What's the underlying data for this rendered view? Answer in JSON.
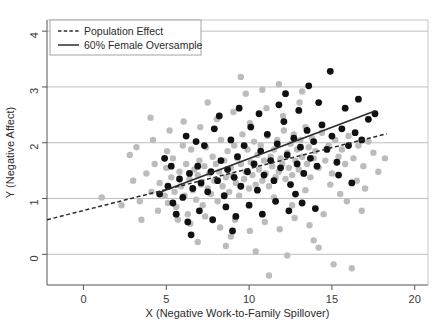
{
  "chart_data": {
    "type": "scatter",
    "title": "",
    "xlabel": "X (Negative Work-to-Family Spillover)",
    "ylabel": "Y (Negative Affect)",
    "xlim": [
      -2.2,
      20.8
    ],
    "ylim": [
      -0.55,
      4.2
    ],
    "xticks": [
      0,
      5,
      10,
      15,
      20
    ],
    "yticks": [
      0,
      1,
      2,
      3,
      4
    ],
    "xtick_labels": [
      "0",
      "5",
      "10",
      "15",
      "20"
    ],
    "ytick_labels": [
      "0",
      "1",
      "2",
      "3",
      "4"
    ],
    "grid": "horizontal",
    "grid_color": "#b8b8b8",
    "legend_position": "top-left",
    "series": [
      {
        "name": "Population Sample",
        "marker": "circle",
        "color": "#bcbcbc",
        "size": 3.2,
        "points": [
          [
            1.1,
            1.02
          ],
          [
            2.3,
            0.88
          ],
          [
            3.0,
            1.32
          ],
          [
            3.4,
            0.95
          ],
          [
            3.8,
            1.45
          ],
          [
            4.1,
            1.12
          ],
          [
            4.3,
            1.62
          ],
          [
            4.5,
            0.78
          ],
          [
            4.6,
            1.28
          ],
          [
            4.9,
            1.05
          ],
          [
            5.0,
            1.55
          ],
          [
            5.1,
            0.92
          ],
          [
            5.3,
            1.38
          ],
          [
            5.4,
            1.72
          ],
          [
            5.5,
            1.12
          ],
          [
            5.6,
            0.85
          ],
          [
            5.8,
            1.48
          ],
          [
            5.9,
            1.22
          ],
          [
            6.0,
            1.95
          ],
          [
            6.1,
            1.05
          ],
          [
            6.2,
            1.62
          ],
          [
            6.3,
            0.72
          ],
          [
            6.4,
            1.35
          ],
          [
            6.5,
            1.88
          ],
          [
            6.6,
            1.15
          ],
          [
            6.7,
            1.52
          ],
          [
            6.8,
            0.98
          ],
          [
            6.9,
            1.42
          ],
          [
            7.0,
            1.68
          ],
          [
            7.1,
            1.25
          ],
          [
            7.2,
            0.88
          ],
          [
            7.3,
            1.58
          ],
          [
            7.4,
            1.92
          ],
          [
            7.5,
            1.18
          ],
          [
            7.6,
            1.45
          ],
          [
            7.7,
            1.08
          ],
          [
            7.8,
            1.75
          ],
          [
            7.9,
            1.32
          ],
          [
            8.0,
            1.62
          ],
          [
            8.1,
            0.95
          ],
          [
            8.2,
            1.48
          ],
          [
            8.3,
            2.05
          ],
          [
            8.4,
            1.22
          ],
          [
            8.5,
            1.68
          ],
          [
            8.6,
            1.38
          ],
          [
            8.7,
            1.85
          ],
          [
            8.8,
            1.12
          ],
          [
            8.9,
            1.55
          ],
          [
            9.0,
            1.42
          ],
          [
            9.1,
            1.95
          ],
          [
            9.2,
            1.28
          ],
          [
            9.3,
            1.72
          ],
          [
            9.4,
            1.05
          ],
          [
            9.5,
            1.62
          ],
          [
            9.6,
            2.15
          ],
          [
            9.7,
            1.35
          ],
          [
            9.8,
            1.48
          ],
          [
            9.9,
            1.88
          ],
          [
            10.0,
            1.18
          ],
          [
            10.1,
            1.65
          ],
          [
            10.2,
            1.42
          ],
          [
            10.3,
            2.02
          ],
          [
            10.4,
            1.25
          ],
          [
            10.5,
            1.78
          ],
          [
            10.6,
            1.52
          ],
          [
            10.7,
            1.95
          ],
          [
            10.8,
            1.32
          ],
          [
            10.9,
            1.68
          ],
          [
            11.0,
            1.45
          ],
          [
            11.1,
            2.12
          ],
          [
            11.2,
            1.22
          ],
          [
            11.3,
            1.75
          ],
          [
            11.4,
            1.58
          ],
          [
            11.5,
            1.88
          ],
          [
            11.6,
            1.38
          ],
          [
            11.7,
            2.05
          ],
          [
            11.8,
            1.48
          ],
          [
            11.9,
            1.72
          ],
          [
            12.0,
            1.62
          ],
          [
            12.1,
            2.22
          ],
          [
            12.2,
            1.35
          ],
          [
            12.3,
            1.82
          ],
          [
            12.4,
            1.55
          ],
          [
            12.5,
            1.98
          ],
          [
            12.6,
            1.42
          ],
          [
            12.7,
            2.15
          ],
          [
            12.8,
            1.68
          ],
          [
            12.9,
            1.88
          ],
          [
            13.0,
            1.52
          ],
          [
            13.1,
            2.05
          ],
          [
            13.2,
            1.75
          ],
          [
            13.3,
            1.45
          ],
          [
            13.4,
            2.28
          ],
          [
            13.5,
            1.62
          ],
          [
            13.6,
            1.92
          ],
          [
            13.7,
            1.38
          ],
          [
            13.8,
            2.08
          ],
          [
            13.9,
            1.72
          ],
          [
            14.0,
            1.85
          ],
          [
            14.2,
            1.55
          ],
          [
            14.4,
            2.18
          ],
          [
            14.6,
            1.68
          ],
          [
            14.8,
            1.95
          ],
          [
            15.0,
            1.45
          ],
          [
            15.2,
            2.05
          ],
          [
            15.4,
            1.75
          ],
          [
            15.6,
            1.88
          ],
          [
            15.8,
            1.62
          ],
          [
            16.0,
            2.12
          ],
          [
            16.3,
            1.72
          ],
          [
            16.6,
            1.95
          ],
          [
            16.9,
            1.58
          ],
          [
            17.2,
            2.02
          ],
          [
            17.5,
            1.82
          ],
          [
            4.2,
            2.05
          ],
          [
            5.2,
            2.22
          ],
          [
            6.05,
            2.38
          ],
          [
            7.05,
            2.28
          ],
          [
            8.05,
            2.42
          ],
          [
            9.05,
            2.55
          ],
          [
            10.05,
            2.35
          ],
          [
            11.05,
            2.62
          ],
          [
            12.05,
            2.48
          ],
          [
            13.05,
            2.72
          ],
          [
            9.5,
            3.18
          ],
          [
            11.8,
            3.05
          ],
          [
            13.2,
            2.92
          ],
          [
            5.7,
            0.62
          ],
          [
            6.45,
            0.55
          ],
          [
            7.35,
            0.68
          ],
          [
            8.25,
            0.48
          ],
          [
            9.15,
            0.62
          ],
          [
            10.05,
            0.42
          ],
          [
            10.95,
            0.58
          ],
          [
            11.85,
            0.45
          ],
          [
            12.75,
            0.65
          ],
          [
            13.65,
            0.52
          ],
          [
            8.6,
            0.15
          ],
          [
            10.4,
            0.05
          ],
          [
            12.3,
            -0.02
          ],
          [
            14.2,
            0.12
          ],
          [
            15.1,
            -0.18
          ],
          [
            16.2,
            -0.25
          ],
          [
            11.2,
            -0.38
          ],
          [
            2.8,
            1.78
          ],
          [
            3.5,
            0.62
          ],
          [
            4.05,
            2.45
          ],
          [
            14.9,
            1.25
          ],
          [
            15.5,
            1.08
          ],
          [
            16.5,
            1.32
          ],
          [
            17.0,
            1.18
          ],
          [
            17.8,
            1.48
          ],
          [
            18.2,
            1.72
          ],
          [
            6.9,
            0.22
          ],
          [
            13.9,
            0.25
          ],
          [
            9.8,
            2.88
          ],
          [
            12.6,
            0.88
          ],
          [
            7.5,
            2.72
          ],
          [
            10.8,
            2.95
          ],
          [
            15.9,
            0.95
          ],
          [
            3.2,
            1.92
          ],
          [
            14.5,
            0.72
          ],
          [
            8.9,
            0.32
          ],
          [
            11.5,
            1.02
          ],
          [
            5.05,
            1.85
          ],
          [
            13.4,
            1.15
          ],
          [
            16.8,
            0.78
          ]
        ]
      },
      {
        "name": "60% Female Oversample",
        "marker": "circle",
        "color": "#111111",
        "size": 3.4,
        "points": [
          [
            4.6,
            1.08
          ],
          [
            5.1,
            1.22
          ],
          [
            5.4,
            0.92
          ],
          [
            5.8,
            1.35
          ],
          [
            6.0,
            1.02
          ],
          [
            6.2,
            2.12
          ],
          [
            6.4,
            1.45
          ],
          [
            6.6,
            1.18
          ],
          [
            6.9,
            1.58
          ],
          [
            7.1,
            1.28
          ],
          [
            7.3,
            1.95
          ],
          [
            7.5,
            1.12
          ],
          [
            7.7,
            1.48
          ],
          [
            7.9,
            2.25
          ],
          [
            8.1,
            1.32
          ],
          [
            8.3,
            1.68
          ],
          [
            8.5,
            1.05
          ],
          [
            8.7,
            1.52
          ],
          [
            8.9,
            2.05
          ],
          [
            9.1,
            1.38
          ],
          [
            9.3,
            1.75
          ],
          [
            9.5,
            1.22
          ],
          [
            9.7,
            1.95
          ],
          [
            9.9,
            1.48
          ],
          [
            10.1,
            2.28
          ],
          [
            10.3,
            1.62
          ],
          [
            10.5,
            1.15
          ],
          [
            10.7,
            1.85
          ],
          [
            10.9,
            1.42
          ],
          [
            11.1,
            2.15
          ],
          [
            11.3,
            1.68
          ],
          [
            11.5,
            1.32
          ],
          [
            11.7,
            1.98
          ],
          [
            11.9,
            1.55
          ],
          [
            12.1,
            2.38
          ],
          [
            12.3,
            1.78
          ],
          [
            12.5,
            1.25
          ],
          [
            12.7,
            2.08
          ],
          [
            12.9,
            1.62
          ],
          [
            13.1,
            1.92
          ],
          [
            13.3,
            1.45
          ],
          [
            13.5,
            2.22
          ],
          [
            13.7,
            1.72
          ],
          [
            13.9,
            2.02
          ],
          [
            14.1,
            1.58
          ],
          [
            14.4,
            2.32
          ],
          [
            14.7,
            1.88
          ],
          [
            15.0,
            2.12
          ],
          [
            15.3,
            1.65
          ],
          [
            15.6,
            2.25
          ],
          [
            16.0,
            1.95
          ],
          [
            16.4,
            2.18
          ],
          [
            16.8,
            2.05
          ],
          [
            17.2,
            2.42
          ],
          [
            17.6,
            2.52
          ],
          [
            6.8,
            2.02
          ],
          [
            8.2,
            2.48
          ],
          [
            9.4,
            2.62
          ],
          [
            10.6,
            2.52
          ],
          [
            11.8,
            2.68
          ],
          [
            13.0,
            2.58
          ],
          [
            14.2,
            2.72
          ],
          [
            15.8,
            2.62
          ],
          [
            16.6,
            2.78
          ],
          [
            12.2,
            2.88
          ],
          [
            14.9,
            3.28
          ],
          [
            13.6,
            3.02
          ],
          [
            5.6,
            0.72
          ],
          [
            6.3,
            0.58
          ],
          [
            7.0,
            0.78
          ],
          [
            7.8,
            0.62
          ],
          [
            8.6,
            0.85
          ],
          [
            9.2,
            0.68
          ],
          [
            10.0,
            0.88
          ],
          [
            10.8,
            0.72
          ],
          [
            11.6,
            0.95
          ],
          [
            12.4,
            0.78
          ],
          [
            13.2,
            0.92
          ],
          [
            14.0,
            0.82
          ],
          [
            6.5,
            0.35
          ],
          [
            9.0,
            0.42
          ],
          [
            4.9,
            1.72
          ],
          [
            5.3,
            1.58
          ],
          [
            12.8,
            1.08
          ],
          [
            15.4,
            1.42
          ],
          [
            16.2,
            1.28
          ]
        ]
      }
    ],
    "lines": [
      {
        "name": "Population Effect",
        "style": "dashed",
        "color": "#2b2b2b",
        "x0": -2.2,
        "y0": 0.62,
        "x1": 18.3,
        "y1": 2.16
      },
      {
        "name": "60% Female Oversample",
        "style": "solid",
        "color": "#2b2b2b",
        "x0": 4.5,
        "y0": 1.1,
        "x1": 17.6,
        "y1": 2.57
      }
    ],
    "legend": [
      {
        "label": "Population Effect",
        "style": "dashed"
      },
      {
        "label": "60% Female Oversample",
        "style": "solid"
      }
    ]
  }
}
